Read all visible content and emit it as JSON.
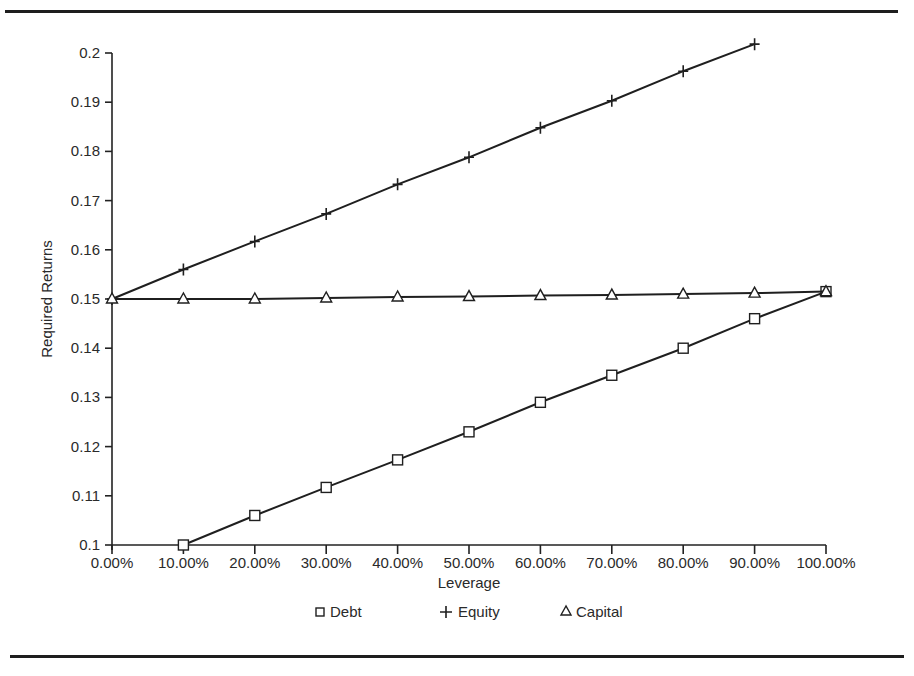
{
  "chart_data": {
    "type": "line",
    "title": "",
    "xlabel": "Leverage",
    "ylabel": "Required Returns",
    "x_tick_labels": [
      "0.00%",
      "10.00%",
      "20.00%",
      "30.00%",
      "40.00%",
      "50.00%",
      "60.00%",
      "70.00%",
      "80.00%",
      "90.00%",
      "100.00%"
    ],
    "y_tick_labels": [
      "0.1",
      "0.11",
      "0.12",
      "0.13",
      "0.14",
      "0.15",
      "0.16",
      "0.17",
      "0.18",
      "0.19",
      "0.2"
    ],
    "xlim": [
      0,
      1.0
    ],
    "ylim": [
      0.1,
      0.2
    ],
    "grid": false,
    "legend_position": "bottom",
    "series": [
      {
        "name": "Debt",
        "marker": "square",
        "x": [
          0.1,
          0.2,
          0.3,
          0.4,
          0.5,
          0.6,
          0.7,
          0.8,
          0.9,
          1.0
        ],
        "values": [
          0.1,
          0.106,
          0.1117,
          0.1173,
          0.123,
          0.129,
          0.1345,
          0.14,
          0.146,
          0.1515
        ]
      },
      {
        "name": "Equity",
        "marker": "plus",
        "x": [
          0.0,
          0.1,
          0.2,
          0.3,
          0.4,
          0.5,
          0.6,
          0.7,
          0.8,
          0.9
        ],
        "values": [
          0.15,
          0.156,
          0.1617,
          0.1673,
          0.1733,
          0.1788,
          0.1848,
          0.1903,
          0.1963,
          0.2018
        ]
      },
      {
        "name": "Capital",
        "marker": "triangle",
        "x": [
          0.0,
          0.1,
          0.2,
          0.3,
          0.4,
          0.5,
          0.6,
          0.7,
          0.8,
          0.9,
          1.0
        ],
        "values": [
          0.15,
          0.15,
          0.15,
          0.1502,
          0.1504,
          0.1505,
          0.1507,
          0.1508,
          0.151,
          0.1512,
          0.1515
        ]
      }
    ]
  },
  "legend": {
    "items": [
      {
        "label": "Debt",
        "symbol": "square"
      },
      {
        "label": "Equity",
        "symbol": "plus"
      },
      {
        "label": "Capital",
        "symbol": "triangle"
      }
    ]
  }
}
